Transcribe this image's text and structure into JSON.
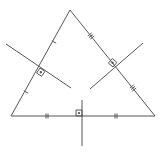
{
  "diagram": {
    "stroke_color": "#555555",
    "background": "#ffffff",
    "vertices": {
      "A": [
        11,
        116
      ],
      "B": [
        155,
        116
      ],
      "C": [
        70,
        10
      ]
    },
    "bisectors": [
      {
        "side": "AB",
        "from": [
          82,
          100
        ],
        "to": [
          82,
          146
        ],
        "midpoint": [
          82,
          116
        ],
        "tick_marks": 2
      },
      {
        "side": "AC",
        "from": [
          6,
          44
        ],
        "to": [
          71,
          88
        ],
        "midpoint": [
          40,
          68
        ],
        "tick_marks": 1
      },
      {
        "side": "BC",
        "from": [
          143,
          43
        ],
        "to": [
          90,
          89
        ],
        "midpoint": [
          113,
          67
        ],
        "tick_marks": 3
      }
    ]
  }
}
